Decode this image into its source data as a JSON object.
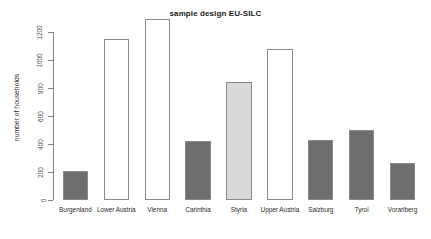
{
  "chart_data": {
    "type": "bar",
    "title": "sample design EU-SILC",
    "xlabel": "",
    "ylabel": "number of households",
    "categories": [
      "Burgenland",
      "Lower Austria",
      "Vienna",
      "Carinthia",
      "Styria",
      "Upper Austria",
      "Salzburg",
      "Tyrol",
      "Vorarlberg"
    ],
    "values": [
      210,
      1150,
      1290,
      425,
      845,
      1080,
      430,
      500,
      265
    ],
    "bar_colors": [
      "#6e6e6e",
      "#ffffff",
      "#ffffff",
      "#6e6e6e",
      "#d9d9d9",
      "#ffffff",
      "#6e6e6e",
      "#6e6e6e",
      "#6e6e6e"
    ],
    "bar_border_color": "#8a8a8a",
    "ylim": [
      0,
      1290
    ],
    "yticks": [
      0,
      200,
      400,
      600,
      800,
      1000,
      1200
    ],
    "ytick_labels": [
      "0",
      "200",
      "400",
      "600",
      "800",
      "1000",
      "1200"
    ],
    "grid": false,
    "legend": null,
    "axis_color": "#808080",
    "background": "#ffffff"
  }
}
